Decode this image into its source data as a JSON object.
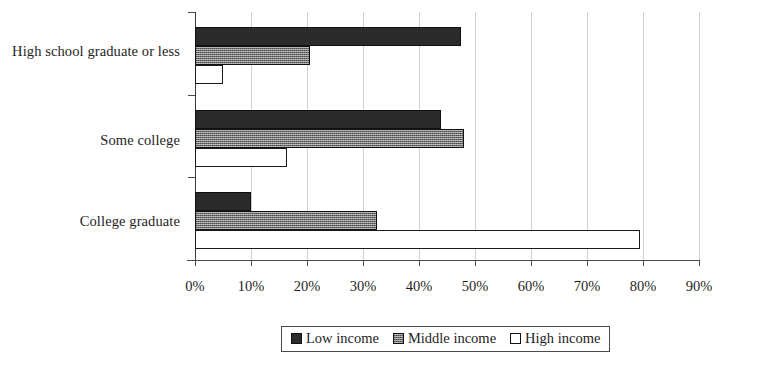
{
  "chart_data": {
    "type": "bar",
    "orientation": "horizontal",
    "grouping": "grouped",
    "title": "",
    "subtitle": "",
    "xlabel": "",
    "ylabel": "",
    "categories": [
      "High school graduate or less",
      "Some college",
      "College graduate"
    ],
    "series": [
      {
        "name": "Low income",
        "color": "#2b2b2b",
        "fill": "solid-black",
        "values": [
          47.5,
          44.0,
          10.0
        ]
      },
      {
        "name": "Middle income",
        "color": "#6e6e6e",
        "fill": "gray-hatched",
        "values": [
          20.5,
          48.0,
          32.5
        ]
      },
      {
        "name": "High income",
        "color": "#ffffff",
        "fill": "white-outline",
        "values": [
          5.0,
          16.5,
          79.5
        ]
      }
    ],
    "xlim": [
      0,
      90
    ],
    "xticks": [
      0,
      10,
      20,
      30,
      40,
      50,
      60,
      70,
      80,
      90
    ],
    "xtick_labels": [
      "0%",
      "10%",
      "20%",
      "30%",
      "40%",
      "50%",
      "60%",
      "70%",
      "80%",
      "90%"
    ],
    "value_format": "percent",
    "grid": {
      "vertical": true,
      "horizontal": false,
      "color": "#cfcfcf"
    },
    "legend": {
      "position": "bottom",
      "boxed": true
    }
  },
  "axis": {
    "tick_labels": [
      "0%",
      "10%",
      "20%",
      "30%",
      "40%",
      "50%",
      "60%",
      "70%",
      "80%",
      "90%"
    ]
  },
  "category_labels": [
    "High school graduate or less",
    "Some college",
    "College graduate"
  ],
  "legend": {
    "items": [
      {
        "label": "Low income",
        "swatch": "legend-swatch-low-income"
      },
      {
        "label": "Middle income",
        "swatch": "legend-swatch-middle-income"
      },
      {
        "label": "High income",
        "swatch": "legend-swatch-high-income"
      }
    ]
  }
}
